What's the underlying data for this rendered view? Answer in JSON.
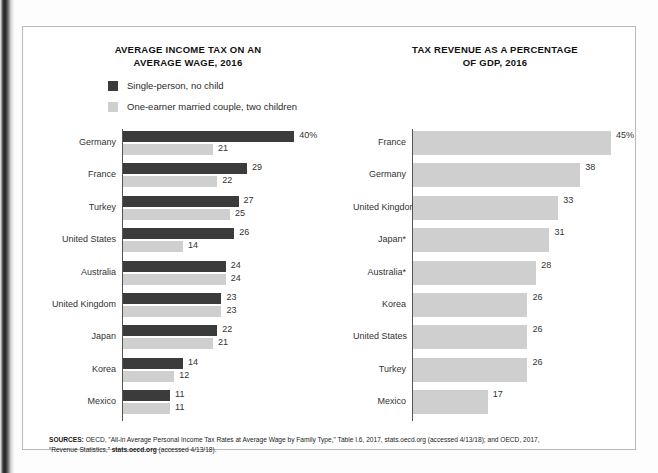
{
  "figure": {
    "sources_label": "SOURCES:",
    "sources_line1": " OECD, \"All-in Average Personal Income Tax Rates at Average Wage by Family Type,\" Table I.6, 2017, stats.oecd.org (accessed 4/13/18); and OECD, 2017,",
    "sources_line2_pre": "“Revenue Statistics,” ",
    "sources_line2_bold": "stats.oecd.org",
    "sources_line2_post": " (accessed 4/13/18)."
  },
  "legend": {
    "items": [
      {
        "label": "Single-person, no child",
        "color": "#3b3b3b"
      },
      {
        "label": "One-earner married couple, two children",
        "color": "#cfcfcf"
      }
    ]
  },
  "colors": {
    "dark_bar": "#3b3b3b",
    "light_bar": "#cfcfcf",
    "axis": "#555555",
    "text": "#333333",
    "frame": "#b9b9b9"
  },
  "chart_data": [
    {
      "id": "average-income-tax",
      "type": "bar",
      "orientation": "horizontal",
      "title": "AVERAGE INCOME TAX ON AN AVERAGE WAGE, 2016",
      "title_line1": "AVERAGE INCOME TAX ON AN",
      "title_line2": "AVERAGE WAGE, 2016",
      "xlabel": "",
      "ylabel": "",
      "xlim": [
        0,
        40
      ],
      "grid": false,
      "legend_position": "top-left",
      "unit": "%",
      "first_value_suffix": "%",
      "categories": [
        "Germany",
        "France",
        "Turkey",
        "United States",
        "Australia",
        "United Kingdom",
        "Japan",
        "Korea",
        "Mexico"
      ],
      "series": [
        {
          "name": "Single-person, no child",
          "color": "#3b3b3b",
          "values": [
            40,
            29,
            27,
            26,
            24,
            23,
            22,
            14,
            11
          ],
          "labels": [
            "40%",
            "29",
            "27",
            "26",
            "24",
            "23",
            "22",
            "14",
            "11"
          ]
        },
        {
          "name": "One-earner married couple, two children",
          "color": "#cfcfcf",
          "values": [
            21,
            22,
            25,
            14,
            24,
            23,
            21,
            12,
            11
          ],
          "labels": [
            "21",
            "22",
            "25",
            "14",
            "24",
            "23",
            "21",
            "12",
            "11"
          ]
        }
      ]
    },
    {
      "id": "tax-revenue-pct-gdp",
      "type": "bar",
      "orientation": "horizontal",
      "title": "TAX REVENUE AS A PERCENTAGE OF GDP, 2016",
      "title_line1": "TAX REVENUE AS A PERCENTAGE",
      "title_line2": "OF GDP, 2016",
      "xlabel": "",
      "ylabel": "",
      "xlim": [
        0,
        45
      ],
      "grid": false,
      "legend_position": "none",
      "unit": "%",
      "categories": [
        "France",
        "Germany",
        "United Kingdom",
        "Japan*",
        "Australia*",
        "Korea",
        "United States",
        "Turkey",
        "Mexico"
      ],
      "series": [
        {
          "name": "Tax revenue as a percentage of GDP",
          "color": "#cfcfcf",
          "values": [
            45,
            38,
            33,
            31,
            28,
            26,
            26,
            26,
            17
          ],
          "labels": [
            "45%",
            "38",
            "33",
            "31",
            "28",
            "26",
            "26",
            "26",
            "17"
          ]
        }
      ]
    }
  ]
}
